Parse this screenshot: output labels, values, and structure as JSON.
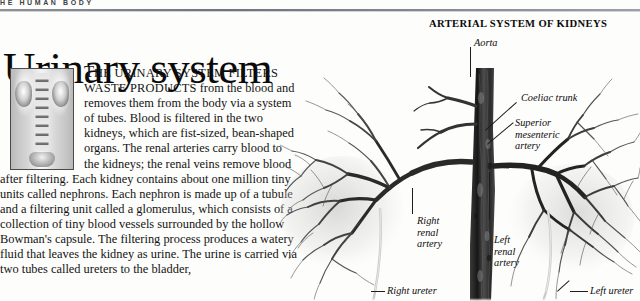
{
  "running_head": "HE HUMAN BODY",
  "headline": "Urinary system",
  "body": {
    "lead_dropcap": "T",
    "lead_smallcaps": "HE URINARY SYSTEM FILTERS WASTE PRODUCTS",
    "paragraph": " from the blood and removes them from the body via a system of tubes. Blood is filtered in the two kidneys, which are fist-sized, bean-shaped organs. The renal arteries carry blood to the kidneys; the renal veins remove blood after filtering. Each kidney contains about one million tiny units called nephrons. Each nephron is made up of a tubule and a filtering unit called a glomerulus, which consists of a collection of tiny blood vessels surrounded by the hollow Bowman's capsule. The filtering process produces a watery fluid that leaves the kidney as urine. The urine is carried via two tubes called ureters to the bladder,"
  },
  "figures": {
    "xray_thumbnail": {
      "name": "intravenous-urogram-xray",
      "alt": "X-ray urogram showing kidneys, ureters and bladder"
    },
    "arteriogram": {
      "title": "ARTERIAL SYSTEM OF KIDNEYS",
      "alt": "Arteriogram of the abdominal aorta and renal arterial trees"
    }
  },
  "labels": [
    {
      "id": "aorta",
      "text": "Aorta"
    },
    {
      "id": "coeliac-trunk",
      "text": "Coeliac trunk"
    },
    {
      "id": "superior-mesenteric",
      "text": "Superior\nmesenteric\nartery"
    },
    {
      "id": "right-renal-artery",
      "text": "Right\nrenal\nartery"
    },
    {
      "id": "left-renal-artery",
      "text": "Left\nrenal\nartery"
    },
    {
      "id": "right-ureter",
      "text": "Right ureter"
    },
    {
      "id": "left-ureter",
      "text": "Left ureter"
    }
  ],
  "colors": {
    "page_background": "#fdfdfb",
    "text": "#111111",
    "rule": "#6f737a",
    "vessel_dark": "#2b2b2b",
    "vessel_mid": "#595959"
  }
}
